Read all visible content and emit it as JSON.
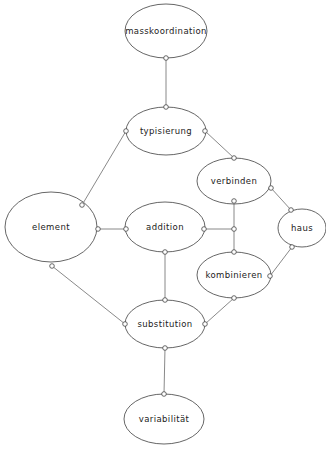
{
  "diagram": {
    "type": "concept-network",
    "colors": {
      "line": "#6b6b6b",
      "outline": "#555555",
      "text": "#222222",
      "background": "#ffffff"
    },
    "nodes": [
      {
        "id": "masskoordination",
        "label": "masskoordination",
        "cx": 166,
        "cy": 31,
        "rx": 41,
        "ry": 27
      },
      {
        "id": "typisierung",
        "label": "typisierung",
        "cx": 166,
        "cy": 131,
        "rx": 40,
        "ry": 24
      },
      {
        "id": "verbinden",
        "label": "verbinden",
        "cx": 234,
        "cy": 181,
        "rx": 37,
        "ry": 23
      },
      {
        "id": "haus",
        "label": "haus",
        "cx": 302,
        "cy": 228,
        "rx": 24,
        "ry": 19
      },
      {
        "id": "element",
        "label": "element",
        "cx": 51,
        "cy": 227,
        "rx": 46,
        "ry": 35
      },
      {
        "id": "addition",
        "label": "addition",
        "cx": 165,
        "cy": 227,
        "rx": 40,
        "ry": 25
      },
      {
        "id": "kombinieren",
        "label": "kombinieren",
        "cx": 234,
        "cy": 275,
        "rx": 37,
        "ry": 23
      },
      {
        "id": "substitution",
        "label": "substitution",
        "cx": 165,
        "cy": 324,
        "rx": 40,
        "ry": 24
      },
      {
        "id": "variabilitaet",
        "label": "variabilität",
        "cx": 164,
        "cy": 419,
        "rx": 40,
        "ry": 25
      }
    ],
    "edges": [
      {
        "from": "masskoordination",
        "to": "typisierung",
        "x1": 166,
        "y1": 58,
        "x2": 166,
        "y2": 107
      },
      {
        "from": "typisierung",
        "to": "element",
        "x1": 126,
        "y1": 131,
        "x2": 82,
        "y2": 205
      },
      {
        "from": "typisierung",
        "to": "verbinden",
        "x1": 205,
        "y1": 131,
        "x2": 234,
        "y2": 158
      },
      {
        "from": "verbinden",
        "to": "haus",
        "x1": 271,
        "y1": 188,
        "x2": 291,
        "y2": 210
      },
      {
        "from": "verbinden",
        "to": "junction",
        "x1": 234,
        "y1": 201,
        "x2": 234,
        "y2": 229
      },
      {
        "from": "addition",
        "to": "junction",
        "x1": 204,
        "y1": 229,
        "x2": 234,
        "y2": 229
      },
      {
        "from": "junction",
        "to": "kombinieren",
        "x1": 234,
        "y1": 229,
        "x2": 234,
        "y2": 252
      },
      {
        "from": "haus",
        "to": "kombinieren",
        "x1": 292,
        "y1": 247,
        "x2": 270,
        "y2": 276
      },
      {
        "from": "element",
        "to": "addition",
        "x1": 98,
        "y1": 229,
        "x2": 126,
        "y2": 229
      },
      {
        "from": "element",
        "to": "substitution",
        "x1": 52,
        "y1": 266,
        "x2": 125,
        "y2": 324
      },
      {
        "from": "addition",
        "to": "substitution",
        "x1": 165,
        "y1": 252,
        "x2": 165,
        "y2": 300
      },
      {
        "from": "kombinieren",
        "to": "substitution",
        "x1": 234,
        "y1": 298,
        "x2": 205,
        "y2": 324
      },
      {
        "from": "substitution",
        "to": "variabilitaet",
        "x1": 165,
        "y1": 348,
        "x2": 164,
        "y2": 394
      }
    ],
    "ports": [
      {
        "x": 166,
        "y": 58
      },
      {
        "x": 166,
        "y": 107
      },
      {
        "x": 126,
        "y": 131
      },
      {
        "x": 205,
        "y": 131
      },
      {
        "x": 234,
        "y": 158
      },
      {
        "x": 271,
        "y": 188
      },
      {
        "x": 234,
        "y": 201
      },
      {
        "x": 291,
        "y": 210
      },
      {
        "x": 292,
        "y": 247
      },
      {
        "x": 82,
        "y": 205
      },
      {
        "x": 98,
        "y": 229
      },
      {
        "x": 52,
        "y": 266
      },
      {
        "x": 126,
        "y": 229
      },
      {
        "x": 204,
        "y": 229
      },
      {
        "x": 165,
        "y": 252
      },
      {
        "x": 234,
        "y": 229
      },
      {
        "x": 234,
        "y": 252
      },
      {
        "x": 270,
        "y": 276
      },
      {
        "x": 234,
        "y": 298
      },
      {
        "x": 165,
        "y": 300
      },
      {
        "x": 125,
        "y": 324
      },
      {
        "x": 205,
        "y": 324
      },
      {
        "x": 165,
        "y": 348
      },
      {
        "x": 164,
        "y": 394
      }
    ]
  }
}
